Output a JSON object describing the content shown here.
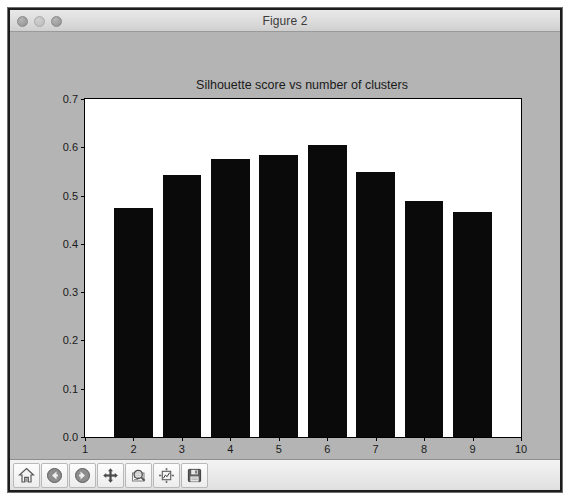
{
  "window": {
    "title": "Figure 2",
    "traffic_lights": [
      "close-button",
      "minimize-button",
      "zoom-button"
    ]
  },
  "colors": {
    "bar": "#0a0a0a",
    "figure_background": "#b4b4b4",
    "axes_background": "#ffffff",
    "axis": "#000000",
    "titlebar_text": "#3b3b3b"
  },
  "toolbar": {
    "buttons": [
      {
        "name": "home-icon",
        "label": "Home"
      },
      {
        "name": "back-arrow-icon",
        "label": "Back"
      },
      {
        "name": "forward-arrow-icon",
        "label": "Forward"
      },
      {
        "name": "pan-icon",
        "label": "Pan"
      },
      {
        "name": "zoom-magnifier-icon",
        "label": "Zoom to rectangle"
      },
      {
        "name": "configure-subplots-icon",
        "label": "Configure subplots"
      },
      {
        "name": "save-floppy-icon",
        "label": "Save"
      }
    ]
  },
  "chart_data": {
    "type": "bar",
    "title": "Silhouette score vs number of clusters",
    "xlabel": "",
    "ylabel": "",
    "categories": [
      2,
      3,
      4,
      5,
      6,
      7,
      8,
      9
    ],
    "values": [
      0.475,
      0.542,
      0.576,
      0.585,
      0.605,
      0.548,
      0.488,
      0.465
    ],
    "bar_width": 0.8,
    "xlim": [
      1,
      10
    ],
    "ylim": [
      0.0,
      0.7
    ],
    "xticks": [
      1,
      2,
      3,
      4,
      5,
      6,
      7,
      8,
      9,
      10
    ],
    "xticklabels": [
      "1",
      "2",
      "3",
      "4",
      "5",
      "6",
      "7",
      "8",
      "9",
      "10"
    ],
    "yticks": [
      0.0,
      0.1,
      0.2,
      0.3,
      0.4,
      0.5,
      0.6,
      0.7
    ],
    "yticklabels": [
      "0.0",
      "0.1",
      "0.2",
      "0.3",
      "0.4",
      "0.5",
      "0.6",
      "0.7"
    ],
    "grid": false,
    "legend": null
  }
}
